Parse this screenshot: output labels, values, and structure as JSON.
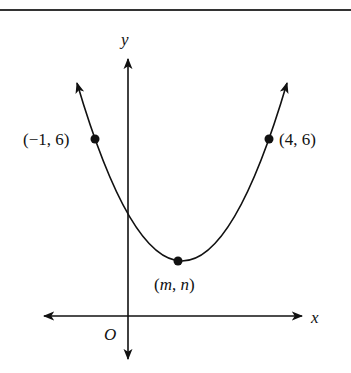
{
  "diagram": {
    "type": "parabola-graph",
    "axes": {
      "x_label": "x",
      "y_label": "y",
      "origin_label": "O"
    },
    "points": [
      {
        "label": "(−1, 6)",
        "x": -1,
        "y": 6
      },
      {
        "label": "(4, 6)",
        "x": 4,
        "y": 6
      },
      {
        "label_open": "(",
        "label_m": "m",
        "label_sep": ", ",
        "label_n": "n",
        "label_close": ")",
        "role": "vertex"
      }
    ],
    "colors": {
      "ink": "#111111",
      "background": "#ffffff"
    }
  }
}
